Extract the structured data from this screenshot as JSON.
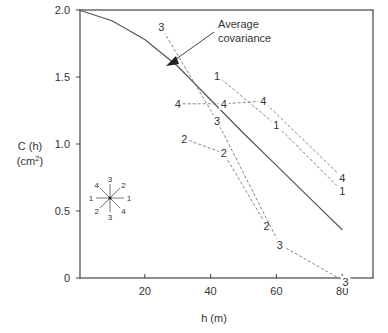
{
  "chart_data": {
    "type": "line",
    "title": "",
    "xlabel": "h (m)",
    "ylabel_line1": "C (h)",
    "ylabel_line2": "(cm",
    "ylabel_sup": "2",
    "ylabel_close": ")",
    "xlim": [
      0,
      90
    ],
    "ylim": [
      0,
      2.0
    ],
    "grid": false,
    "x_ticks": [
      {
        "value": 20,
        "label": "20"
      },
      {
        "value": 40,
        "label": "40"
      },
      {
        "value": 60,
        "label": "60"
      },
      {
        "value": 80,
        "label": "80"
      }
    ],
    "y_ticks": [
      {
        "value": 0,
        "label": "0"
      },
      {
        "value": 0.5,
        "label": "0.5"
      },
      {
        "value": 1.0,
        "label": "1.0"
      },
      {
        "value": 1.5,
        "label": "1.5"
      },
      {
        "value": 2.0,
        "label": "2.0"
      }
    ],
    "annotation": {
      "line1": "Average",
      "line2": "covariance"
    },
    "series": [
      {
        "name": "Average covariance",
        "style": "solid",
        "x": [
          0,
          10,
          20,
          30,
          40,
          50,
          60,
          70,
          80
        ],
        "y": [
          2.0,
          1.92,
          1.78,
          1.58,
          1.33,
          1.08,
          0.84,
          0.6,
          0.36
        ]
      },
      {
        "name": "1",
        "style": "dashed",
        "x": [
          42,
          60,
          80
        ],
        "y": [
          1.51,
          1.14,
          0.65
        ]
      },
      {
        "name": "2",
        "style": "dashed",
        "x": [
          32,
          44,
          57
        ],
        "y": [
          1.04,
          0.93,
          0.39
        ]
      },
      {
        "name": "3",
        "style": "dashed",
        "x": [
          25,
          42,
          61,
          81
        ],
        "y": [
          1.87,
          1.17,
          0.25,
          -0.03
        ]
      },
      {
        "name": "4",
        "style": "dashed",
        "x": [
          30,
          44,
          56,
          80
        ],
        "y": [
          1.3,
          1.3,
          1.32,
          0.75
        ]
      }
    ],
    "direction_inset": {
      "labels": [
        "3",
        "2",
        "1",
        "4",
        "3",
        "2",
        "1",
        "4"
      ]
    }
  }
}
